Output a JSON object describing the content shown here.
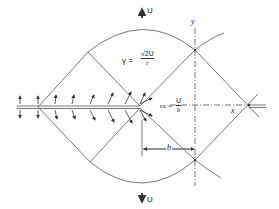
{
  "diagram": {
    "labels": {
      "top_velocity": "U",
      "bottom_velocity": "U",
      "y_axis": "y",
      "x_axis": "x",
      "distance": "b",
      "gamma_lhs": "γ =",
      "gamma_num": "√2U",
      "gamma_den": "r",
      "strain_lhs": "ϵx =",
      "strain_num": "U",
      "strain_den": "b"
    },
    "colors": {
      "line": "#555555",
      "text": "#222222",
      "background": "#ffffff"
    }
  }
}
